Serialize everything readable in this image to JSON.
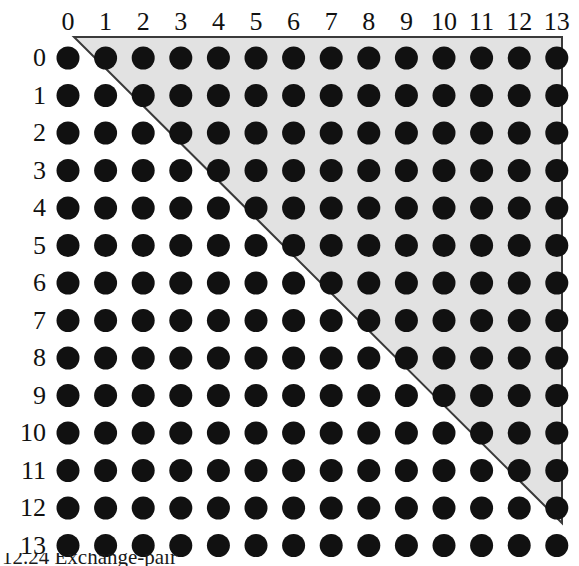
{
  "figure": {
    "type": "dot-matrix-triangle",
    "caption": "12.24 Exchange-pair",
    "column_header_label": "column index",
    "row_header_label": "row index",
    "column_labels": [
      "0",
      "1",
      "2",
      "3",
      "4",
      "5",
      "6",
      "7",
      "8",
      "9",
      "10",
      "11",
      "12",
      "13"
    ],
    "row_labels": [
      "0",
      "1",
      "2",
      "3",
      "4",
      "5",
      "6",
      "7",
      "8",
      "9",
      "10",
      "11",
      "12",
      "13"
    ],
    "grid": {
      "rows": 14,
      "cols": 14,
      "origin_x": 68,
      "origin_y": 58,
      "step_x": 37.6,
      "step_y": 37.5,
      "dot_radius": 11.5,
      "dot_color": "#111111"
    },
    "region": {
      "name": "shaded-upper-triangle",
      "rule": "column index greater than row index",
      "fill_color": "#e2e2e2",
      "stroke_color": "#3a3a3a",
      "stroke_width": 2,
      "vertices": [
        [
          74,
          37
        ],
        [
          562,
          37
        ],
        [
          562,
          523
        ],
        [
          74,
          37
        ]
      ],
      "top_edge_y": 37,
      "right_edge_x": 562,
      "diagonal_from": [
        74,
        37
      ],
      "diagonal_to": [
        545,
        523
      ]
    },
    "colors": {
      "background": "#ffffff",
      "shading": "#e2e2e2",
      "outline": "#3a3a3a",
      "dot": "#111111",
      "label": "#111111"
    }
  }
}
